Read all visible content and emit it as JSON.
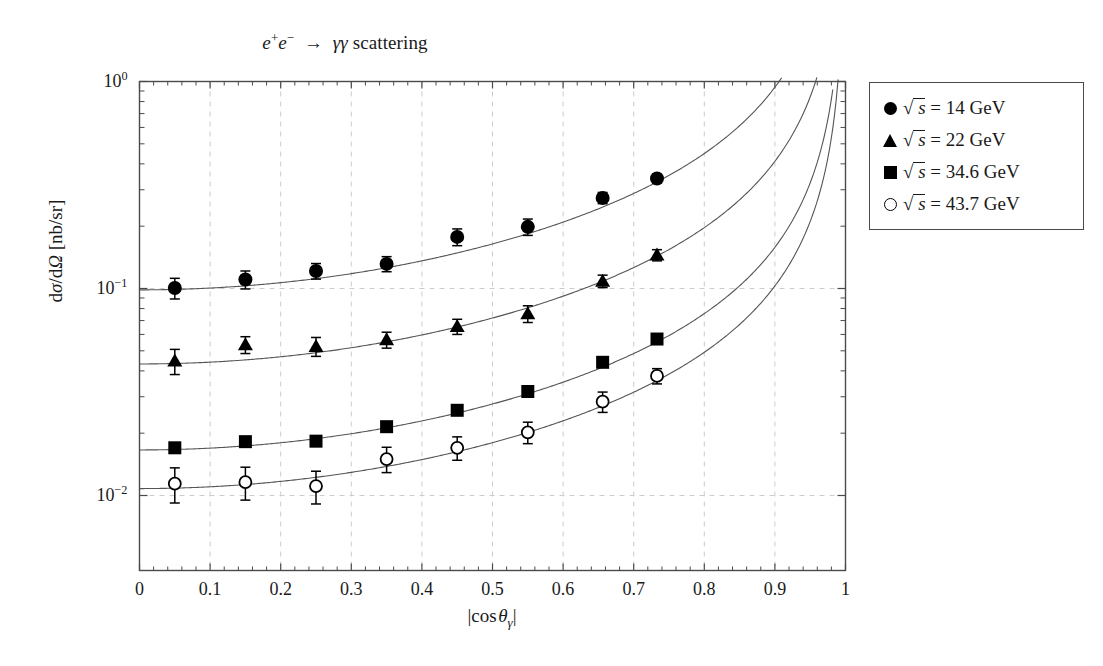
{
  "chart_data": {
    "type": "scatter",
    "title_parts": {
      "e": "e",
      "plus": "+",
      "minus": "−",
      "arrow": "→",
      "gamma": "γ",
      "word": "scattering"
    },
    "xlabel": "|cos θγ|",
    "ylabel": "dσ/dΩ [nb/sr]",
    "xscale": "linear",
    "yscale": "log",
    "xlim": [
      0,
      1
    ],
    "ylim": [
      0.00437,
      1.0
    ],
    "grid": true,
    "grid_style": "dashed light gray, major x every 0.1 and major y each decade",
    "minor_ticks": true,
    "legend_position": "outside right top",
    "xticks": [
      "0",
      "0.1",
      "0.2",
      "0.3",
      "0.4",
      "0.5",
      "0.6",
      "0.7",
      "0.8",
      "0.9",
      "1"
    ],
    "xtick_values": [
      0,
      0.1,
      0.2,
      0.3,
      0.4,
      0.5,
      0.6,
      0.7,
      0.8,
      0.9,
      1
    ],
    "yticks": [
      "10^0",
      "10^-1",
      "10^-2"
    ],
    "ytick_values": [
      1,
      0.1,
      0.01
    ],
    "series": [
      {
        "name": "sqrt(s) = 14 GeV",
        "energy_value": "14",
        "marker": "filled-circle",
        "x": [
          0.05,
          0.15,
          0.25,
          0.35,
          0.45,
          0.55,
          0.656,
          0.733
        ],
        "y": [
          0.1005,
          0.1105,
          0.1215,
          0.1315,
          0.1775,
          0.1985,
          0.274,
          0.34
        ],
        "yerr": [
          0.0115,
          0.011,
          0.0105,
          0.011,
          0.0165,
          0.018,
          0.017,
          0.017
        ],
        "curve_A": 0.0985,
        "curve_desc": "QED: A/(1-x^2) style rise toward |cos| = 1"
      },
      {
        "name": "sqrt(s) = 22 GeV",
        "energy_value": "22",
        "marker": "filled-triangle",
        "x": [
          0.05,
          0.15,
          0.25,
          0.35,
          0.45,
          0.55,
          0.656,
          0.733
        ],
        "y": [
          0.0446,
          0.0535,
          0.0525,
          0.0565,
          0.0655,
          0.0755,
          0.1085,
          0.145
        ],
        "yerr": [
          0.0062,
          0.005,
          0.0055,
          0.005,
          0.0055,
          0.007,
          0.0075,
          0.009
        ],
        "curve_A": 0.0432,
        "curve_desc": "QED theory curve"
      },
      {
        "name": "sqrt(s) = 34.6 GeV",
        "energy_value": "34.6",
        "marker": "filled-square",
        "x": [
          0.05,
          0.15,
          0.25,
          0.35,
          0.45,
          0.55,
          0.656,
          0.733
        ],
        "y": [
          0.017,
          0.0182,
          0.0183,
          0.0215,
          0.0258,
          0.0318,
          0.044,
          0.057
        ],
        "yerr": [
          0.0,
          0.0,
          0.0,
          0.0,
          0.0,
          0.0,
          0.0,
          0.0
        ],
        "curve_A": 0.0166,
        "curve_desc": "QED theory curve"
      },
      {
        "name": "sqrt(s) = 43.7 GeV",
        "energy_value": "43.7",
        "marker": "open-circle",
        "x": [
          0.05,
          0.15,
          0.25,
          0.35,
          0.45,
          0.55,
          0.656,
          0.733
        ],
        "y": [
          0.0114,
          0.0116,
          0.0111,
          0.015,
          0.017,
          0.0202,
          0.0284,
          0.0378
        ],
        "yerr": [
          0.0022,
          0.0021,
          0.002,
          0.0021,
          0.0022,
          0.0024,
          0.0032,
          0.0032
        ],
        "curve_A": 0.0108,
        "curve_desc": "QED theory curve"
      }
    ],
    "colors": {
      "marker": "#000000",
      "curve": "#555555",
      "grid": "#cccccc",
      "axis": "#4a4a4a",
      "text": "#1a1a1a"
    }
  },
  "legend": {
    "entries": [
      {
        "marker": "filled-circle",
        "sqrt_s": "s",
        "eq": "=",
        "value": "14",
        "unit": "GeV"
      },
      {
        "marker": "filled-triangle",
        "sqrt_s": "s",
        "eq": "=",
        "value": "22",
        "unit": "GeV"
      },
      {
        "marker": "filled-square",
        "sqrt_s": "s",
        "eq": "=",
        "value": "34.6",
        "unit": "GeV"
      },
      {
        "marker": "open-circle",
        "sqrt_s": "s",
        "eq": "=",
        "value": "43.7",
        "unit": "GeV"
      }
    ]
  }
}
